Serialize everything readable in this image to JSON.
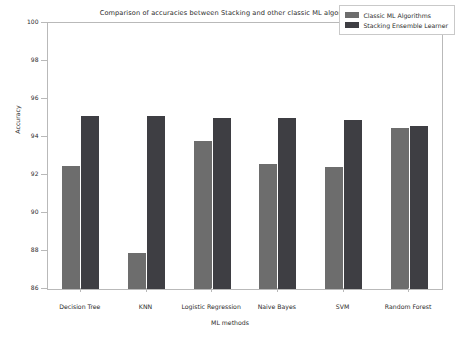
{
  "chart_data": {
    "type": "bar",
    "title": "Comparison of accuracies between Stacking and other classic ML algorithms",
    "xlabel": "ML methods",
    "ylabel": "Accuracy",
    "ylim": [
      86,
      100
    ],
    "yticks": [
      86,
      88,
      90,
      92,
      94,
      96,
      98,
      100
    ],
    "grid": false,
    "legend_position": "upper right",
    "categories": [
      "Decision Tree",
      "KNN",
      "Logistic Regression",
      "Naive Bayes",
      "SVM",
      "Random Forest"
    ],
    "series": [
      {
        "name": "Classic ML Algorithms",
        "color": "#6d6d6d",
        "values": [
          92.5,
          87.9,
          93.8,
          92.6,
          92.4,
          94.5
        ]
      },
      {
        "name": "Stacking Ensemble Learner",
        "color": "#3e3e43",
        "values": [
          95.1,
          95.1,
          95.0,
          95.0,
          94.9,
          94.6
        ]
      }
    ]
  }
}
